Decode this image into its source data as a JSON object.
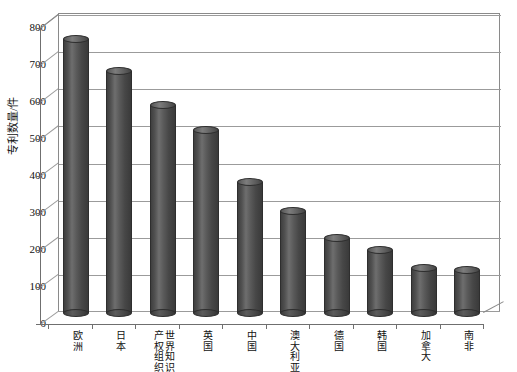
{
  "chart_data": {
    "type": "bar",
    "title": "",
    "subtitle": "",
    "xlabel": "",
    "ylabel": "专利数量/件",
    "categories": [
      "欧洲",
      "日本",
      "世界知识产权组织",
      "英国",
      "中国",
      "澳大利亚",
      "德国",
      "韩国",
      "加拿大",
      "南非"
    ],
    "values": [
      765,
      675,
      580,
      510,
      365,
      285,
      210,
      175,
      125,
      120
    ],
    "ylim": [
      0,
      800
    ],
    "yticks": [
      0,
      100,
      200,
      300,
      400,
      500,
      600,
      700,
      800
    ],
    "ytick_labels": [
      "0",
      "100",
      "200",
      "300",
      "400",
      "500",
      "600",
      "700",
      "800"
    ],
    "grid": true,
    "legend": false,
    "legend_position": "none",
    "series": [
      {
        "name": "专利数量",
        "values": [
          765,
          675,
          580,
          510,
          365,
          285,
          210,
          175,
          125,
          120
        ]
      }
    ],
    "style": {
      "bar_shape": "cylinder-3d",
      "bar_color": "#4a4a4a",
      "bar_highlight": "#7d7d7d",
      "bar_outline": "#2e2e2e",
      "grid_color": "#9b9b9b",
      "axis_color": "#6f6f6f",
      "plot_background": "#ffffff",
      "text_color": "#111111"
    }
  },
  "axis": {
    "y_title": "专利数量/件"
  },
  "categories_display": [
    {
      "name": "欧洲",
      "columns": [
        "欧洲"
      ]
    },
    {
      "name": "日本",
      "columns": [
        "日本"
      ]
    },
    {
      "name": "世界知识产权组织",
      "columns": [
        "世界知识",
        "产权组织"
      ]
    },
    {
      "name": "英国",
      "columns": [
        "英国"
      ]
    },
    {
      "name": "中国",
      "columns": [
        "中国"
      ]
    },
    {
      "name": "澳大利亚",
      "columns": [
        "澳大利亚"
      ]
    },
    {
      "name": "德国",
      "columns": [
        "德国"
      ]
    },
    {
      "name": "韩国",
      "columns": [
        "韩国"
      ]
    },
    {
      "name": "加拿大",
      "columns": [
        "加拿大"
      ]
    },
    {
      "name": "南非",
      "columns": [
        "南非"
      ]
    }
  ]
}
